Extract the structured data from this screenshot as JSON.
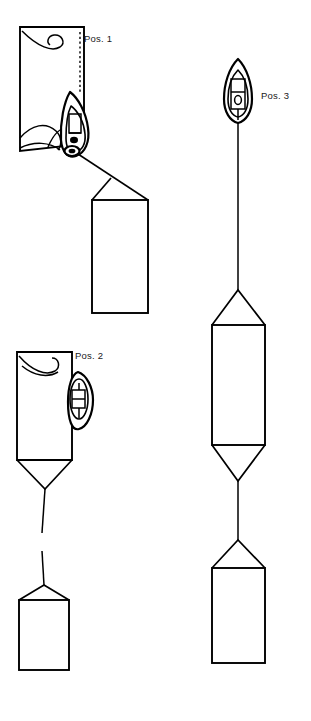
{
  "figure": {
    "background_color": "#ffffff",
    "line_color": "#000000",
    "width": 311,
    "height": 721
  },
  "labels": {
    "pos1": "Pos. 1",
    "pos2": "Pos. 2",
    "pos3": "Pos. 3"
  },
  "groups": [
    {
      "id": "pos1",
      "label": "Pos. 1",
      "label_x": 84,
      "label_y": 39,
      "description": "Vessel alongside deployed net panel, towing second panel on angled bridle",
      "boat_orientation": "angled",
      "panels": 2
    },
    {
      "id": "pos2",
      "label": "Pos. 2",
      "label_x": 75,
      "label_y": 356,
      "description": "Vessel alongside upper panel with funnel bridle to lower panel",
      "boat_orientation": "side",
      "panels": 2
    },
    {
      "id": "pos3",
      "label": "Pos. 3",
      "label_x": 261,
      "label_y": 96,
      "description": "Vessel upright with long vertical tow line to two stacked panels",
      "boat_orientation": "upright",
      "panels": 2
    }
  ]
}
